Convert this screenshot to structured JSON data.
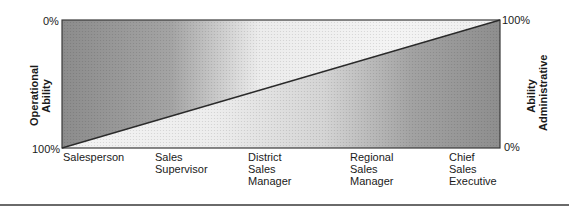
{
  "diagram": {
    "left_axis": {
      "title_line1": "Operational",
      "title_line2": "Ability",
      "top_tick": "0%",
      "bottom_tick": "100%"
    },
    "right_axis": {
      "title_line1": "Administrative",
      "title_line2": "Ability",
      "top_tick": "100%",
      "bottom_tick": "0%"
    },
    "positions": [
      {
        "lines": [
          "Salesperson"
        ]
      },
      {
        "lines": [
          "Sales",
          "Supervisor"
        ]
      },
      {
        "lines": [
          "District",
          "Sales",
          "Manager"
        ]
      },
      {
        "lines": [
          "Regional",
          "Sales",
          "Manager"
        ]
      },
      {
        "lines": [
          "Chief",
          "Sales",
          "Executive"
        ]
      }
    ],
    "colors": {
      "dark_fill": "#8f8f8f",
      "light_fill": "#f2f2f2",
      "line": "#2a2a2a"
    }
  }
}
